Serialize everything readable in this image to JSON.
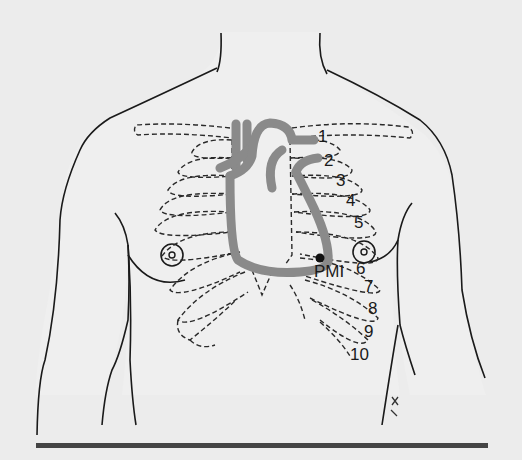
{
  "figure": {
    "labels": {
      "pmi": "PMI",
      "ribs": [
        "1",
        "2",
        "3",
        "4",
        "5",
        "6",
        "7",
        "8",
        "9",
        "10"
      ]
    },
    "colors": {
      "background": "#ececec",
      "outline": "#1a1a1a",
      "heart": "#8a8a8a",
      "rule": "#444444"
    }
  }
}
